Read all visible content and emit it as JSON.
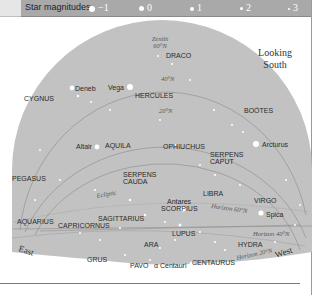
{
  "legend": {
    "label": "Star magnitudes",
    "items": [
      {
        "symbol": "large-star-dot",
        "value": "−1"
      },
      {
        "symbol": "star-dot",
        "value": "0"
      },
      {
        "symbol": "star-dot",
        "value": "1"
      },
      {
        "symbol": "small-star-dot",
        "value": "2"
      },
      {
        "symbol": "tiny-star-dot",
        "value": "3"
      }
    ]
  },
  "heading": {
    "line1": "Looking",
    "line2": "South"
  },
  "zenith": {
    "line1": "Zenith",
    "line2": "60°N"
  },
  "latitude_labels": [
    "40°N",
    "20°N"
  ],
  "ecliptic_label": "Ecliptic",
  "horizon_labels": [
    "Horizon 60°N",
    "Horizon 40°N",
    "Horizon 20°N"
  ],
  "directions": {
    "east": "East",
    "west": "West"
  },
  "constellations": [
    "DRACO",
    "CYGNUS",
    "HERCULES",
    "BOÖTES",
    "AQUILA",
    "OPHIUCHUS",
    "SERPENS",
    "CAPUT",
    "PEGASUS",
    "SERPENS",
    "CAUDA",
    "LIBRA",
    "VIRGO",
    "SCORPIUS",
    "SAGITTARIUS",
    "AQUARIUS",
    "CAPRICORNUS",
    "LUPUS",
    "ARA",
    "HYDRA",
    "GRUS",
    "PAVO",
    "CENTAURUS"
  ],
  "stars": [
    "Deneb",
    "Vega",
    "Arcturus",
    "Altair",
    "Antares",
    "Spica",
    "α Centauri"
  ],
  "colors": {
    "sky": "#c2c2c2",
    "legend_bar": "#a9a9a9",
    "star": "#ffffff"
  }
}
